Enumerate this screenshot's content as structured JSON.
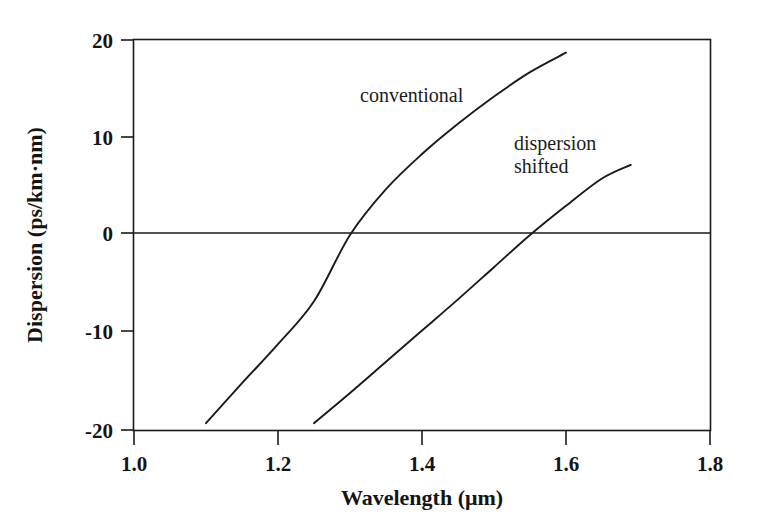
{
  "chart_data": {
    "type": "line",
    "title": "",
    "subtitle": "",
    "xlabel": "Wavelength (μm)",
    "ylabel": "Dispersion (ps/km·nm)",
    "xlim": [
      1.0,
      1.8
    ],
    "ylim": [
      -20,
      20
    ],
    "xticks": [
      "1.0",
      "1.2",
      "1.4",
      "1.6",
      "1.8"
    ],
    "xtick_values": [
      1.0,
      1.2,
      1.4,
      1.6,
      1.8
    ],
    "yticks": [
      "20",
      "10",
      "0",
      "-10",
      "-20"
    ],
    "ytick_values": [
      20,
      10,
      0,
      -10,
      -20
    ],
    "grid": false,
    "legend": "inline-annotations",
    "zero_line": true,
    "annotations": [
      {
        "text": "conventional",
        "x": 1.31,
        "y": 13.2
      },
      {
        "text": "dispersion",
        "x": 1.55,
        "y": 9.5
      },
      {
        "text": "shifted",
        "x": 1.55,
        "y": 7.0
      }
    ],
    "series": [
      {
        "name": "conventional",
        "label": "conventional",
        "color": "#1a1a1a",
        "zero_dispersion_wavelength": 1.3,
        "x": [
          1.1,
          1.15,
          1.2,
          1.25,
          1.3,
          1.35,
          1.4,
          1.45,
          1.5,
          1.55,
          1.6
        ],
        "y": [
          -19.3,
          -15.2,
          -11.2,
          -6.8,
          0.0,
          4.7,
          8.3,
          11.4,
          14.2,
          16.7,
          18.7
        ]
      },
      {
        "name": "dispersion shifted",
        "label": "dispersion shifted",
        "color": "#1a1a1a",
        "zero_dispersion_wavelength": 1.55,
        "x": [
          1.25,
          1.3,
          1.35,
          1.4,
          1.45,
          1.5,
          1.55,
          1.6,
          1.65,
          1.69
        ],
        "y": [
          -19.3,
          -16.2,
          -13.0,
          -9.8,
          -6.6,
          -3.3,
          0.0,
          3.0,
          5.8,
          7.2
        ]
      }
    ]
  }
}
